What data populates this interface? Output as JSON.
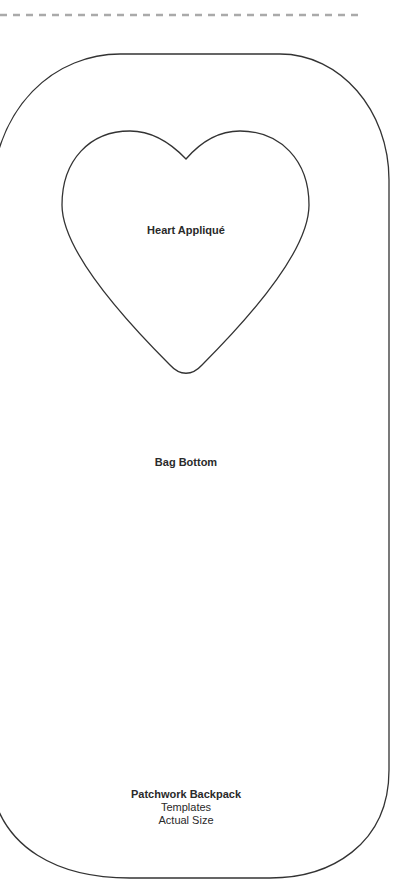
{
  "document": {
    "type": "sewing-template",
    "cut_line": {
      "style": "dashed",
      "color": "#aaaaaa"
    },
    "outline_color": "#333333",
    "pieces": [
      {
        "id": "heart",
        "label": "Heart Appliqué"
      },
      {
        "id": "bag-bottom",
        "label": "Bag Bottom"
      }
    ],
    "caption": {
      "title": "Patchwork Backpack",
      "line2": "Templates",
      "line3": "Actual Size"
    }
  }
}
